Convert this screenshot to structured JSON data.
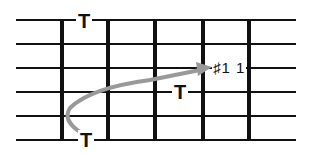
{
  "diagram": {
    "type": "guitar-fretboard",
    "strings_count": 6,
    "frets_count": 5,
    "string_y": [
      20,
      44,
      68,
      92,
      116,
      140
    ],
    "fret_x": [
      62,
      108,
      155,
      203,
      249
    ],
    "left_x": 16,
    "right_x": 296,
    "line_color": "#111111",
    "arrow_color": "#999999",
    "labels": [
      {
        "id": "tap-top",
        "text": "T",
        "x": 78,
        "y": 12
      },
      {
        "id": "tap-bottom",
        "text": "T",
        "x": 80,
        "y": 130
      },
      {
        "id": "tap-mid",
        "text": "T",
        "x": 174,
        "y": 83
      },
      {
        "id": "note-sharp11",
        "text": "♯1 1",
        "x": 212,
        "y": 60
      }
    ]
  }
}
